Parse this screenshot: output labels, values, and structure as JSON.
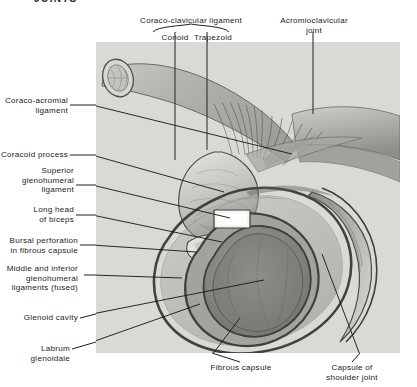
{
  "page": {
    "header": "JOINTS",
    "background_color": "#ffffff",
    "photo_tone": "#d9d9d6",
    "ink_color": "#1c1c1c"
  },
  "figure": {
    "name": "shoulder-joint-dissection-photograph",
    "glenoid_label_in_image": ""
  },
  "labels": {
    "coraco_clavicular_ligament": "Coraco-clavicular ligament",
    "conoid": "Conoid",
    "trapezoid": "Trapezoid",
    "acromioclavicular_joint": "Acromioclavicular\njoint",
    "coraco_acromial_ligament": "Coraco-acromial\nligament",
    "coracoid_process": "Coracoid process",
    "superior_glenohumeral_ligament": "Superior\nglenohumeral\nligament",
    "long_head_of_biceps": "Long head\nof biceps",
    "bursal_perforation": "Bursal perforation\nin fibrous capsule",
    "middle_inferior_glenohumeral": "Middle and inferior\nglenohumeral\nligaments (fused)",
    "glenoid_cavity": "Glenoid cavity",
    "labrum_glenoidale": "Labrum glenoidale",
    "fibrous_capsule": "Fibrous capsule",
    "capsule_of_shoulder_joint": "Capsule of\nshoulder joint"
  }
}
